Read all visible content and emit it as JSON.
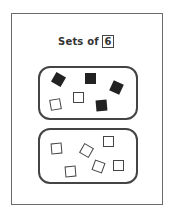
{
  "title": "Sets of",
  "number": "6",
  "sets": [
    {
      "name": "set-1",
      "items": [
        {
          "type": "filled",
          "x": 53,
          "y": 74,
          "rot": 30
        },
        {
          "type": "filled",
          "x": 85,
          "y": 73,
          "rot": 0
        },
        {
          "type": "filled",
          "x": 111,
          "y": 82,
          "rot": 25
        },
        {
          "type": "empty",
          "x": 50,
          "y": 99,
          "rot": -10
        },
        {
          "type": "empty",
          "x": 73,
          "y": 92,
          "rot": 0
        },
        {
          "type": "filled",
          "x": 96,
          "y": 100,
          "rot": -5
        }
      ]
    },
    {
      "name": "set-2",
      "items": [
        {
          "type": "empty",
          "x": 51,
          "y": 143,
          "rot": -5
        },
        {
          "type": "empty",
          "x": 81,
          "y": 145,
          "rot": 30
        },
        {
          "type": "empty",
          "x": 103,
          "y": 136,
          "rot": 0
        },
        {
          "type": "empty",
          "x": 65,
          "y": 166,
          "rot": -5
        },
        {
          "type": "empty",
          "x": 93,
          "y": 161,
          "rot": 20
        },
        {
          "type": "empty",
          "x": 113,
          "y": 160,
          "rot": 0
        }
      ]
    }
  ]
}
